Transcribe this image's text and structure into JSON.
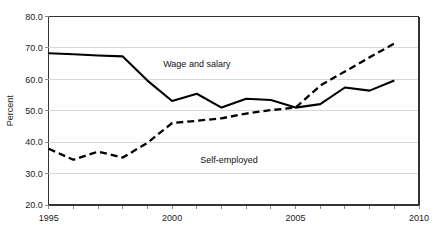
{
  "chart_data": {
    "type": "line",
    "title": "",
    "subtitle": "",
    "xlabel": "",
    "ylabel": "Percent",
    "xlim": [
      1995,
      2010
    ],
    "ylim": [
      20.0,
      80.0
    ],
    "grid": true,
    "legend_position": "inline-annotation",
    "x": [
      1995,
      1996,
      1997,
      1998,
      1999,
      2000,
      2001,
      2002,
      2003,
      2004,
      2005,
      2006,
      2007,
      2008,
      2009
    ],
    "xtick_labels": [
      "1995",
      "2000",
      "2005",
      "2010"
    ],
    "xtick_values": [
      1995,
      2000,
      2005,
      2010
    ],
    "ytick_labels": [
      "20.0",
      "30.0",
      "40.0",
      "50.0",
      "60.0",
      "70.0",
      "80.0"
    ],
    "ytick_values": [
      20.0,
      30.0,
      40.0,
      50.0,
      60.0,
      70.0,
      80.0
    ],
    "series": [
      {
        "name": "Wage and salary",
        "style": "solid",
        "color": "#000000",
        "annotation": "Wage and salary",
        "values": [
          68.3,
          68.0,
          67.6,
          67.3,
          59.6,
          53.1,
          55.4,
          51.0,
          53.8,
          53.4,
          51.0,
          52.1,
          57.4,
          56.4,
          59.6
        ]
      },
      {
        "name": "Self-employed",
        "style": "dashed",
        "color": "#000000",
        "annotation": "Self-employed",
        "values": [
          37.9,
          34.4,
          37.0,
          35.1,
          39.8,
          46.1,
          46.8,
          47.6,
          49.1,
          50.2,
          51.0,
          58.0,
          62.5,
          67.0,
          71.4
        ]
      }
    ],
    "annotations": [
      {
        "text": "Wage and salary",
        "x": 2001.0,
        "y": 64.0
      },
      {
        "text": "Self-employed",
        "x": 2002.3,
        "y": 33.4
      }
    ]
  }
}
